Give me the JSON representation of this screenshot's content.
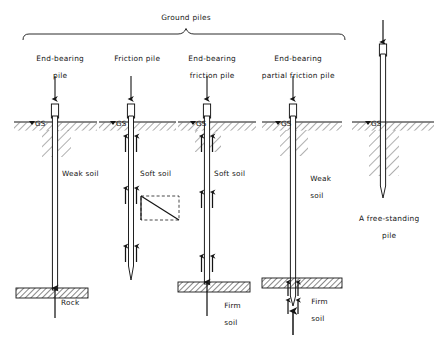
{
  "figure": {
    "domain_note": "engineering cross-section diagram of pile foundation types",
    "group_bracket_label": "Ground piles",
    "ground_surface_marker": "GS",
    "background_color": "#ffffff",
    "line_color": "#141414"
  },
  "columns": [
    {
      "id": "end-bearing-pile",
      "heading": "End-bearing\npile",
      "heading_lines": [
        "End-bearing",
        "pile"
      ],
      "center_x": 55,
      "gs_label": "GS",
      "soil_labels": [
        {
          "text": "Weak soil",
          "x": 58,
          "y": 174
        }
      ],
      "bearing_layer_label": "Rock",
      "has_top_load_arrow": true,
      "has_tip_reaction_arrow": true,
      "has_shaft_friction_arrows": false
    },
    {
      "id": "friction-pile",
      "heading": "Friction pile",
      "heading_lines": [
        "Friction pile"
      ],
      "center_x": 131,
      "gs_label": "GS",
      "soil_labels": [
        {
          "text": "Soft soil",
          "x": 137,
          "y": 174
        }
      ],
      "bearing_layer_label": "",
      "has_top_load_arrow": true,
      "has_tip_reaction_arrow": false,
      "has_shaft_friction_arrows": true,
      "friction_distribution_diagram": true
    },
    {
      "id": "end-bearing-friction-pile",
      "heading": "End-bearing\nfriction pile",
      "heading_lines": [
        "End-bearing",
        "friction pile"
      ],
      "center_x": 207,
      "gs_label": "GS",
      "soil_labels": [
        {
          "text": "Soft soil",
          "x": 213,
          "y": 174
        }
      ],
      "bearing_layer_label": "Firm\nsoil",
      "bearing_layer_label_lines": [
        "Firm",
        "soil"
      ],
      "has_top_load_arrow": true,
      "has_tip_reaction_arrow": true,
      "has_shaft_friction_arrows": true
    },
    {
      "id": "end-bearing-partial-friction-pile",
      "heading": "End-bearing\npartial friction pile",
      "heading_lines": [
        "End-bearing",
        "partial friction pile"
      ],
      "center_x": 293,
      "gs_label": "GS",
      "soil_labels": [
        {
          "text": "Weak\nsoil",
          "x": 299,
          "y": 170
        }
      ],
      "bearing_layer_label": "Firm\nsoil",
      "bearing_layer_label_lines": [
        "Firm",
        "soil"
      ],
      "has_top_load_arrow": true,
      "has_tip_reaction_arrow": true,
      "has_shaft_friction_arrows": true,
      "friction_in_bearing_layer_only": true
    },
    {
      "id": "free-standing-pile",
      "heading": "",
      "heading_lines": [],
      "center_x": 383,
      "gs_label": "GS",
      "soil_labels": [],
      "caption": "A free-standing\npile",
      "caption_lines": [
        "A free-standing",
        "pile"
      ],
      "has_top_load_arrow": true,
      "has_tip_reaction_arrow": false,
      "has_shaft_friction_arrows": false
    }
  ],
  "annotations": {
    "weak_soil": "Weak soil",
    "soft_soil": "Soft soil",
    "weak_soil_wrapped_1": "Weak",
    "weak_soil_wrapped_2": "soil",
    "rock": "Rock",
    "firm_1": "Firm",
    "firm_2": "soil",
    "free_standing_1": "A free-standing",
    "free_standing_2": "pile"
  },
  "headings": {
    "c1l1": "End-bearing",
    "c1l2": "pile",
    "c2l1": "Friction pile",
    "c3l1": "End-bearing",
    "c3l2": "friction pile",
    "c4l1": "End-bearing",
    "c4l2": "partial friction pile"
  },
  "geometry_hints": {
    "ground_surface_y": 122,
    "rock_top_y": 288,
    "firm_soil_top_y_col3": 282,
    "firm_soil_top_y_col4": 278,
    "pile_width": 5
  }
}
